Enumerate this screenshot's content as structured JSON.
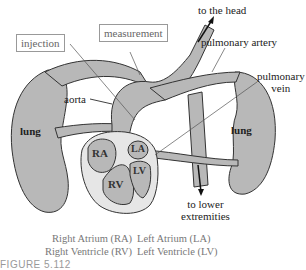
{
  "diagram": {
    "type": "circulatory-system-schematic",
    "colors": {
      "tissue_fill": "#b8b8b8",
      "heart_outer_fill": "#e6e6e6",
      "outline": "#333333",
      "box_border": "#999999"
    },
    "labels": {
      "to_head": "to the head",
      "measurement": "measurement",
      "injection": "injection",
      "pulmonary_artery": "pulmonary artery",
      "pulmonary_vein_line1": "pulmonary",
      "pulmonary_vein_line2": "vein",
      "aorta": "aorta",
      "lung_left": "lung",
      "lung_right": "lung",
      "to_lower_line1": "to lower",
      "to_lower_line2": "extremities"
    },
    "chambers": {
      "ra": "RA",
      "rv": "RV",
      "la": "LA",
      "lv": "LV"
    },
    "legend": [
      {
        "left": "Right Atrium (RA)",
        "right": "Left Atrium (LA)"
      },
      {
        "left": "Right Ventricle (RV)",
        "right": "Left Ventricle (LV)"
      }
    ],
    "caption": "FIGURE 5.112"
  }
}
